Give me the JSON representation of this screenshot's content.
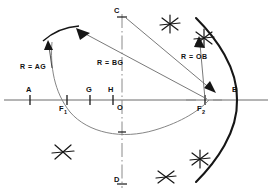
{
  "figure": {
    "background": "#ffffff",
    "ink": "#1a1a1a",
    "thin_ink": "#5a5a5a",
    "width": 272,
    "height": 196
  },
  "axes": {
    "horizontal": {
      "label": "major-axis",
      "y": 100,
      "x1": 4,
      "x2": 268
    },
    "vertical": {
      "label": "minor-axis",
      "x": 122,
      "y1": 14,
      "y2": 188,
      "style": "dash-dot"
    }
  },
  "points": [
    {
      "id": "A",
      "label": "A",
      "x": 30,
      "y": 100,
      "tick": true,
      "label_x": 26,
      "label_y": 88
    },
    {
      "id": "F1",
      "label": "F",
      "sub": "1",
      "x": 67,
      "y": 100,
      "tick": true,
      "label_x": 60,
      "label_y": 105
    },
    {
      "id": "G",
      "label": "G",
      "x": 90,
      "y": 100,
      "tick": true,
      "label_x": 86,
      "label_y": 88
    },
    {
      "id": "H",
      "label": "H",
      "x": 113,
      "y": 100,
      "tick": true,
      "label_x": 107,
      "label_y": 88
    },
    {
      "id": "O",
      "label": "O",
      "x": 122,
      "y": 100,
      "tick": false,
      "label_x": 118,
      "label_y": 105
    },
    {
      "id": "F2",
      "label": "F",
      "sub": "2",
      "x": 205,
      "y": 100,
      "tick": true,
      "label_x": 198,
      "label_y": 105
    },
    {
      "id": "B",
      "label": "B",
      "x": 237,
      "y": 100,
      "tick": false,
      "label_x": 233,
      "label_y": 88
    },
    {
      "id": "C",
      "label": "C",
      "x": 122,
      "y": 14,
      "tick": false,
      "label_x": 114,
      "label_y": 8
    },
    {
      "id": "D",
      "label": "D",
      "x": 122,
      "y": 188,
      "tick": false,
      "label_x": 114,
      "label_y": 176
    }
  ],
  "radius_labels": [
    {
      "id": "R-AG",
      "text": "R = AG",
      "x": 20,
      "y": 63
    },
    {
      "id": "R-BG",
      "text": "R = BG",
      "x": 97,
      "y": 59
    },
    {
      "id": "R-OB",
      "text": "R = OB",
      "x": 182,
      "y": 54
    }
  ],
  "curves": {
    "hyperbola_right_branch": {
      "name": "right-branch",
      "stroke_width": 2.0,
      "vertex": "B"
    },
    "ellipse_arc_lower": {
      "name": "construction-arc-through-F1",
      "stroke_width": 0.8
    },
    "compass_arc_upper_left": {
      "name": "arc-R-AG",
      "stroke_width": 1.4
    }
  },
  "construction_marks": [
    {
      "id": "cross-upper-1",
      "x": 170,
      "y": 24
    },
    {
      "id": "cross-upper-2",
      "x": 204,
      "y": 38
    },
    {
      "id": "cross-lower-1",
      "x": 166,
      "y": 177
    },
    {
      "id": "cross-lower-2",
      "x": 200,
      "y": 159
    },
    {
      "id": "cross-lower-left",
      "x": 63,
      "y": 152
    }
  ],
  "leaders": [
    {
      "id": "leader-R-AG",
      "from": [
        57,
        54
      ],
      "to": [
        78,
        34
      ]
    },
    {
      "id": "leader-R-BG",
      "from": [
        90,
        33
      ],
      "to": [
        208,
        99
      ]
    },
    {
      "id": "leader-R-OB",
      "from": [
        133,
        19
      ],
      "to": [
        212,
        88
      ]
    }
  ]
}
